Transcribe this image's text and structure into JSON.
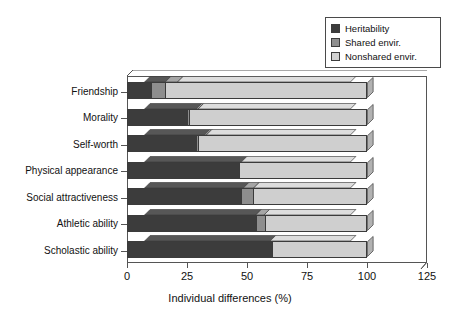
{
  "chart_data": {
    "type": "bar",
    "orientation": "horizontal",
    "stacked": true,
    "title": "",
    "xlabel": "Individual differences (%)",
    "ylabel": "",
    "xlim": [
      0,
      125
    ],
    "xticks": [
      0,
      25,
      50,
      75,
      100,
      125
    ],
    "grid": false,
    "legend_position": "top-right",
    "categories": [
      "Friendship",
      "Morality",
      "Self-worth",
      "Physical appearance",
      "Social attractiveness",
      "Athletic ability",
      "Scholastic ability"
    ],
    "series": [
      {
        "name": "Heritability",
        "color": "#3c3c3c",
        "values": [
          10,
          25,
          29,
          47,
          48,
          54,
          61
        ]
      },
      {
        "name": "Shared envir.",
        "color": "#8e8e8e",
        "values": [
          6,
          1,
          1,
          0,
          5,
          4,
          0
        ]
      },
      {
        "name": "Nonshared envir.",
        "color": "#cfcfcf",
        "values": [
          84,
          74,
          70,
          53,
          47,
          42,
          39
        ]
      }
    ],
    "legend_entries": [
      {
        "label": "Heritability",
        "color": "#3c3c3c"
      },
      {
        "label": "Shared envir.",
        "color": "#8e8e8e"
      },
      {
        "label": "Nonshared envir.",
        "color": "#cfcfcf"
      }
    ],
    "xtick_labels": [
      "0",
      "25",
      "50",
      "75",
      "100",
      "125"
    ]
  },
  "axis": {
    "x_title": "Individual differences (%)"
  }
}
